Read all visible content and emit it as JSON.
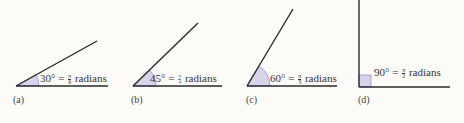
{
  "colors": {
    "line": "#2a2a2a",
    "wedge_fill": "#d6d3ea",
    "wedge_stroke": "#8e88b8",
    "fraction_accent": "#3c9a8a",
    "background": "#fcfbf8"
  },
  "panels": [
    {
      "caption": "(a)",
      "degrees": "30°",
      "equals": "=",
      "num": "π",
      "den": "6",
      "unit": "radians",
      "vertex": [
        16,
        86
      ],
      "ray_end": [
        97,
        41
      ],
      "base_end": [
        108,
        86
      ]
    },
    {
      "caption": "(b)",
      "degrees": "45°",
      "equals": "=",
      "num": "π",
      "den": "4",
      "unit": "radians",
      "vertex": [
        133,
        86
      ],
      "ray_end": [
        198,
        23
      ],
      "base_end": [
        222,
        86
      ]
    },
    {
      "caption": "(c)",
      "degrees": "60°",
      "equals": "=",
      "num": "π",
      "den": "3",
      "unit": "radians",
      "vertex": [
        247,
        86
      ],
      "ray_end": [
        293,
        9
      ],
      "base_end": [
        337,
        86
      ]
    },
    {
      "caption": "(d)",
      "degrees": "90°",
      "equals": "=",
      "num": "π",
      "den": "2",
      "unit": "radians",
      "vertex": [
        359,
        87
      ],
      "ray_end": [
        359,
        0
      ],
      "base_end": [
        450,
        87
      ]
    }
  ]
}
